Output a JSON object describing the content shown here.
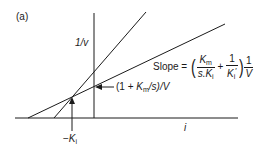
{
  "panel_label": "(a)",
  "axes": {
    "y_label": "1/v",
    "x_label": "i"
  },
  "annotations": {
    "slope": {
      "prefix": "Slope =",
      "term1_num_var": "K",
      "term1_num_sub": "m",
      "term1_den_pre": "s.",
      "term1_den_var": "K",
      "term1_den_sub": "i",
      "plus": "+",
      "term2_num": "1",
      "term2_den_var": "K",
      "term2_den_sub": "i",
      "term2_den_prime": "′",
      "factor_num": "1",
      "factor_den": "V"
    },
    "intercept": {
      "open": "(1 + ",
      "var": "K",
      "sub": "m",
      "rest": "/s)/V"
    },
    "x_intersect": {
      "minus": "−",
      "var": "K",
      "sub": "i"
    }
  },
  "colors": {
    "line": "#1a1a1a",
    "background": "#ffffff"
  }
}
